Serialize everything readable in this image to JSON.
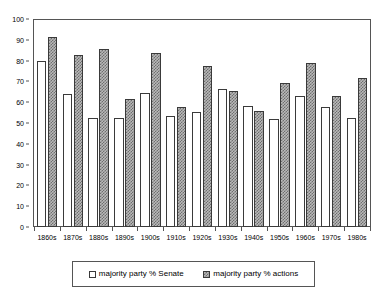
{
  "chart_data": {
    "type": "bar",
    "title": "",
    "subtitle": "",
    "xlabel": "",
    "ylabel": "",
    "ylim": [
      0,
      100
    ],
    "y_ticks": [
      0,
      10,
      20,
      30,
      40,
      50,
      60,
      70,
      80,
      90,
      100
    ],
    "grid": false,
    "legend_position": "bottom",
    "categories": [
      "1860s",
      "1870s",
      "1880s",
      "1890s",
      "1900s",
      "1910s",
      "1920s",
      "1930s",
      "1940s",
      "1950s",
      "1960s",
      "1970s",
      "1980s"
    ],
    "series": [
      {
        "name": "majority party % Senate",
        "swatch": "open-white-box",
        "values": [
          80,
          64,
          52.5,
          52.5,
          64.5,
          53.5,
          55.5,
          66.5,
          58,
          52,
          63,
          57.5,
          52.5
        ]
      },
      {
        "name": "majority party % actions",
        "swatch": "hatched-gray-box",
        "values": [
          91.5,
          82.5,
          85.5,
          61.5,
          83.5,
          57.5,
          77.5,
          65.5,
          56,
          69,
          79,
          63,
          71.5
        ]
      }
    ]
  },
  "legend": {
    "items": [
      {
        "label": "majority party % Senate",
        "style": "senate"
      },
      {
        "label": "majority party % actions",
        "style": "actions"
      }
    ]
  },
  "colors": {
    "axis": "#555555",
    "bar_outline": "#3a3a3a",
    "senate_fill": "#ffffff",
    "actions_fill": "#b9b9b9",
    "background": "#ffffff"
  }
}
